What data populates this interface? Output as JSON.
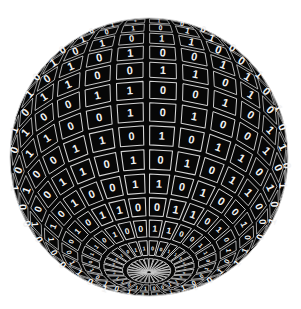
{
  "canvas": {
    "width": 301,
    "height": 309,
    "background_color": "#ffffff"
  },
  "figure": {
    "name": "binary-digit-sphere",
    "center_x": 149,
    "center_y": 157,
    "radius": 139,
    "tilt_degrees": 34,
    "rotation_degrees": 8,
    "latitude_bands": 18,
    "longitude_divisions": 26,
    "cell_fill_color": "#070707",
    "grid_line_color": "#d6d6d6",
    "digit_color": "#f2f2f2",
    "limb_color": "#cfcfcf",
    "digit_alphabet": [
      "0",
      "1"
    ],
    "cell_inset": 0.1,
    "digit_base_size": 11
  },
  "chart_data": {
    "type": "heatmap",
    "title": "",
    "xlabel": "",
    "ylabel": "",
    "grid": true,
    "legend": false,
    "projection": "orthographic-sphere",
    "rows": 18,
    "columns": 26,
    "value_set": [
      0,
      1
    ],
    "values": [
      [
        0,
        1,
        0,
        1,
        1,
        0,
        0,
        1,
        0,
        0,
        1,
        1,
        0,
        1,
        0,
        0,
        1,
        0,
        1,
        1,
        0,
        1,
        0,
        0,
        1,
        0
      ],
      [
        1,
        0,
        0,
        1,
        0,
        1,
        1,
        0,
        1,
        0,
        0,
        1,
        0,
        0,
        1,
        1,
        0,
        1,
        1,
        0,
        0,
        1,
        0,
        1,
        0,
        1
      ],
      [
        0,
        0,
        1,
        0,
        1,
        0,
        0,
        1,
        1,
        0,
        1,
        0,
        1,
        1,
        0,
        0,
        1,
        0,
        0,
        1,
        1,
        0,
        1,
        0,
        0,
        1
      ],
      [
        1,
        1,
        0,
        0,
        1,
        0,
        1,
        0,
        0,
        1,
        0,
        1,
        1,
        0,
        1,
        0,
        0,
        1,
        0,
        0,
        1,
        1,
        0,
        1,
        1,
        0
      ],
      [
        0,
        1,
        1,
        0,
        0,
        1,
        0,
        1,
        0,
        1,
        1,
        0,
        0,
        1,
        0,
        1,
        1,
        0,
        1,
        0,
        0,
        1,
        0,
        0,
        1,
        1
      ],
      [
        1,
        0,
        0,
        1,
        1,
        0,
        1,
        0,
        1,
        0,
        0,
        1,
        1,
        0,
        1,
        1,
        0,
        0,
        1,
        0,
        1,
        0,
        1,
        1,
        0,
        0
      ],
      [
        0,
        1,
        0,
        0,
        1,
        1,
        0,
        1,
        0,
        1,
        0,
        0,
        1,
        1,
        0,
        0,
        1,
        1,
        0,
        1,
        0,
        1,
        0,
        0,
        1,
        0
      ],
      [
        1,
        0,
        1,
        1,
        0,
        0,
        1,
        0,
        1,
        0,
        1,
        1,
        0,
        0,
        1,
        0,
        0,
        1,
        1,
        0,
        1,
        0,
        1,
        0,
        0,
        1
      ],
      [
        0,
        0,
        1,
        0,
        1,
        1,
        0,
        0,
        1,
        1,
        0,
        1,
        0,
        1,
        0,
        1,
        1,
        0,
        0,
        1,
        0,
        0,
        1,
        1,
        0,
        1
      ],
      [
        1,
        1,
        0,
        1,
        0,
        0,
        1,
        1,
        0,
        0,
        1,
        0,
        1,
        0,
        1,
        0,
        0,
        1,
        1,
        0,
        1,
        1,
        0,
        0,
        1,
        0
      ],
      [
        0,
        1,
        0,
        0,
        1,
        0,
        1,
        0,
        0,
        1,
        1,
        0,
        1,
        1,
        0,
        0,
        1,
        0,
        1,
        1,
        0,
        1,
        0,
        1,
        0,
        1
      ],
      [
        1,
        0,
        1,
        1,
        0,
        1,
        0,
        1,
        1,
        0,
        0,
        1,
        0,
        0,
        1,
        1,
        0,
        1,
        0,
        0,
        1,
        0,
        1,
        0,
        1,
        0
      ],
      [
        0,
        1,
        1,
        0,
        1,
        0,
        1,
        0,
        1,
        1,
        0,
        0,
        1,
        0,
        1,
        0,
        1,
        1,
        0,
        1,
        0,
        0,
        1,
        1,
        0,
        0
      ],
      [
        1,
        0,
        0,
        1,
        0,
        1,
        1,
        0,
        0,
        1,
        0,
        1,
        1,
        0,
        0,
        1,
        0,
        0,
        1,
        1,
        0,
        1,
        0,
        1,
        1,
        0
      ],
      [
        0,
        1,
        0,
        1,
        1,
        0,
        0,
        1,
        1,
        0,
        1,
        0,
        0,
        1,
        1,
        0,
        1,
        0,
        1,
        0,
        1,
        0,
        0,
        1,
        0,
        1
      ],
      [
        1,
        1,
        0,
        0,
        1,
        1,
        0,
        0,
        1,
        0,
        1,
        1,
        0,
        1,
        0,
        1,
        0,
        1,
        0,
        0,
        1,
        1,
        0,
        0,
        1,
        0
      ],
      [
        0,
        0,
        1,
        1,
        0,
        0,
        1,
        1,
        0,
        1,
        0,
        0,
        1,
        0,
        1,
        1,
        0,
        1,
        1,
        0,
        0,
        1,
        1,
        0,
        0,
        1
      ],
      [
        1,
        0,
        1,
        0,
        0,
        1,
        0,
        1,
        0,
        1,
        1,
        0,
        1,
        0,
        0,
        1,
        1,
        0,
        0,
        1,
        1,
        0,
        1,
        1,
        0,
        0
      ]
    ]
  }
}
